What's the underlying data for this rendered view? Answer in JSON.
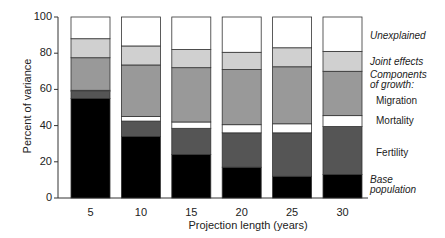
{
  "chart_data": {
    "type": "bar",
    "stacked": true,
    "title": "",
    "xlabel": "Projection length (years)",
    "ylabel": "Percent of variance",
    "ylim": [
      0,
      100
    ],
    "yticks": [
      0,
      20,
      40,
      60,
      80,
      100
    ],
    "categories": [
      "5",
      "10",
      "15",
      "20",
      "25",
      "30"
    ],
    "series": [
      {
        "name": "Base population",
        "color": "#000000",
        "values": [
          55,
          34,
          24,
          17,
          12,
          13
        ]
      },
      {
        "name": "Fertility",
        "color": "#555555",
        "values": [
          4,
          8.5,
          14.5,
          19,
          24,
          26.5
        ]
      },
      {
        "name": "Mortality",
        "color": "#ffffff",
        "values": [
          0.5,
          2.5,
          3.5,
          4.5,
          5,
          6
        ]
      },
      {
        "name": "Migration",
        "color": "#999999",
        "values": [
          18,
          28.5,
          30,
          30.5,
          31.5,
          24.5
        ]
      },
      {
        "name": "Joint effects",
        "color": "#d0d0d0",
        "values": [
          10.5,
          10.5,
          10,
          9.5,
          10.5,
          11
        ]
      },
      {
        "name": "Unexplained",
        "color": "#ffffff",
        "values": [
          12,
          16,
          18,
          19.5,
          17,
          19
        ]
      }
    ],
    "legend_position": "right",
    "grid": false
  },
  "legend": {
    "unexplained": "Unexplained",
    "joint": "Joint effects",
    "components1": "Components",
    "components2": "of growth:",
    "migration": "Migration",
    "mortality": "Mortality",
    "fertility": "Fertility",
    "base1": "Base",
    "base2": "population"
  }
}
